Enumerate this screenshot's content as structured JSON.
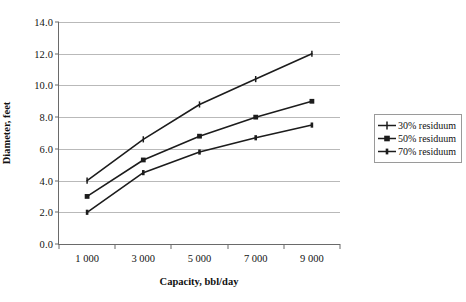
{
  "chart_data": {
    "type": "line",
    "title": "",
    "xlabel": "Capacity, bbl/day",
    "ylabel": "Diameter, feet",
    "categories": [
      "1 000",
      "3 000",
      "5 000",
      "7 000",
      "9 000"
    ],
    "x": [
      1000,
      3000,
      5000,
      7000,
      9000
    ],
    "series": [
      {
        "name": "30% residuum",
        "marker": "cross-plus",
        "values": [
          4.0,
          6.6,
          8.8,
          10.4,
          12.0
        ]
      },
      {
        "name": "50% residuum",
        "marker": "square",
        "values": [
          3.0,
          5.3,
          6.8,
          8.0,
          9.0
        ]
      },
      {
        "name": "70% residuum",
        "marker": "dash-bar",
        "values": [
          2.0,
          4.5,
          5.8,
          6.7,
          7.5
        ]
      }
    ],
    "ylim": [
      0.0,
      14.0
    ],
    "ytick_step": 2.0,
    "yticks": [
      "0.0",
      "2.0",
      "4.0",
      "6.0",
      "8.0",
      "10.0",
      "12.0",
      "14.0"
    ],
    "grid": "horizontal",
    "legend_position": "right",
    "line_color": "#1c1c1c",
    "grid_color": "#b9b9b9",
    "axis_color": "#6a6a6a"
  },
  "legend": {
    "items": [
      {
        "label": "30% residuum"
      },
      {
        "label": "50% residuum"
      },
      {
        "label": "70% residuum"
      }
    ]
  },
  "caption": {
    "text": ""
  }
}
